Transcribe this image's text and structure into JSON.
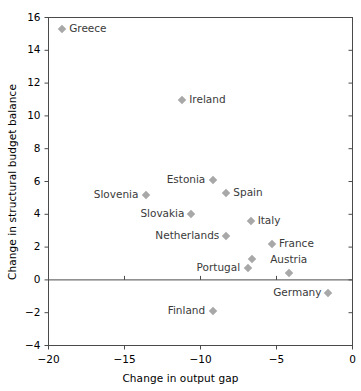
{
  "chart_data": {
    "type": "scatter",
    "title": "",
    "xlabel": "Change in output gap",
    "ylabel": "Change in structural budget balance",
    "xlim": [
      -20,
      0
    ],
    "ylim": [
      -4,
      16
    ],
    "xticks": [
      -20,
      -15,
      -10,
      -5,
      0
    ],
    "yticks": [
      -4,
      -2,
      0,
      2,
      4,
      6,
      8,
      10,
      12,
      14,
      16
    ],
    "xtick_labels": [
      "−20",
      "−15",
      "−10",
      "−5",
      "0"
    ],
    "ytick_labels": [
      "−4",
      "−2",
      "0",
      "2",
      "4",
      "6",
      "8",
      "10",
      "12",
      "14",
      "16"
    ],
    "grid": false,
    "legend": "none",
    "marker_color": "#a8a8a8",
    "marker_shape": "diamond",
    "zero_line": true,
    "points": [
      {
        "label": "Greece",
        "x": -19.1,
        "y": 15.3,
        "label_pos": "right"
      },
      {
        "label": "Ireland",
        "x": -11.2,
        "y": 11.0,
        "label_pos": "right"
      },
      {
        "label": "Estonia",
        "x": -9.2,
        "y": 6.1,
        "label_pos": "left"
      },
      {
        "label": "Spain",
        "x": -8.3,
        "y": 5.3,
        "label_pos": "right"
      },
      {
        "label": "Slovenia",
        "x": -13.6,
        "y": 5.2,
        "label_pos": "left"
      },
      {
        "label": "Slovakia",
        "x": -10.6,
        "y": 4.0,
        "label_pos": "left"
      },
      {
        "label": "Italy",
        "x": -6.7,
        "y": 3.6,
        "label_pos": "right"
      },
      {
        "label": "Netherlands",
        "x": -8.3,
        "y": 2.7,
        "label_pos": "left"
      },
      {
        "label": "France",
        "x": -5.3,
        "y": 2.2,
        "label_pos": "right"
      },
      {
        "label": "Austria",
        "x": -4.2,
        "y": 0.4,
        "label_pos": "above"
      },
      {
        "label": "Portugal",
        "x": -6.9,
        "y": 0.7,
        "label_pos": "left"
      },
      {
        "label": "",
        "x": -6.6,
        "y": 1.3,
        "label_pos": "none"
      },
      {
        "label": "Germany",
        "x": -1.6,
        "y": -0.8,
        "label_pos": "left"
      },
      {
        "label": "Finland",
        "x": -9.2,
        "y": -1.9,
        "label_pos": "left"
      }
    ]
  },
  "axes": {
    "x_title": "Change in output gap",
    "y_title": "Change in structural budget balance"
  }
}
